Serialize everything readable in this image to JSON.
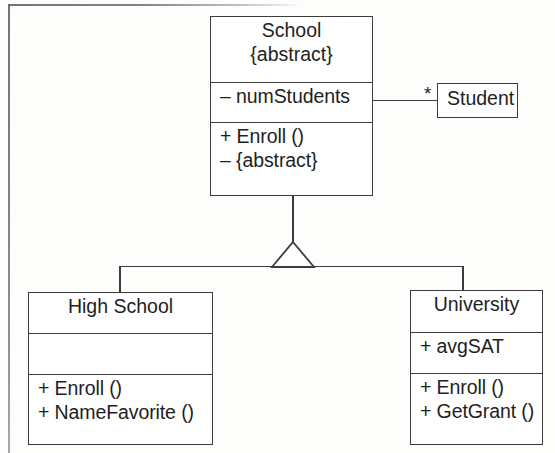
{
  "diagram": {
    "type": "uml-class-diagram",
    "background_color": "#fdfdfc",
    "line_color": "#3c3c3c",
    "text_color": "#1e1e1e"
  },
  "classes": {
    "school": {
      "name": "School",
      "stereotype": "{abstract}",
      "attributes": [
        "– numStudents"
      ],
      "operations": [
        "+ Enroll ()",
        "– {abstract}"
      ]
    },
    "student": {
      "name": "Student"
    },
    "high_school": {
      "name": "High School",
      "attributes": [
        ""
      ],
      "operations": [
        "+ Enroll ()",
        "+ NameFavorite ()"
      ]
    },
    "university": {
      "name": "University",
      "attributes": [
        "+ avgSAT"
      ],
      "operations": [
        "+ Enroll ()",
        "+ GetGrant ()"
      ]
    }
  },
  "relationships": {
    "association_school_student": {
      "source": "School",
      "target": "Student",
      "target_multiplicity": "*"
    },
    "generalization": {
      "parent": "School",
      "children": [
        "High School",
        "University"
      ],
      "arrow": "hollow-triangle"
    }
  }
}
